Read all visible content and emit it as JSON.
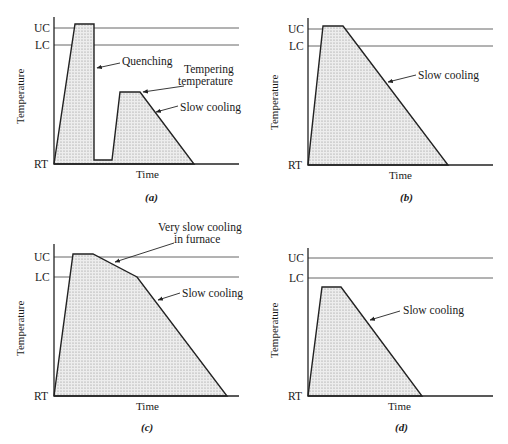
{
  "axis_labels": {
    "y": "Temperature",
    "x": "Time",
    "uc": "UC",
    "lc": "LC",
    "rt": "RT"
  },
  "panels": [
    {
      "id": "a",
      "caption": "(a)",
      "annotations": [
        "Quenching",
        "Tempering",
        "temperature",
        "Slow cooling"
      ]
    },
    {
      "id": "b",
      "caption": "(b)",
      "annotations": [
        "Slow cooling"
      ]
    },
    {
      "id": "c",
      "caption": "(c)",
      "annotations": [
        "Very slow cooling",
        "in furnace",
        "Slow cooling"
      ]
    },
    {
      "id": "d",
      "caption": "(d)",
      "annotations": [
        "Slow cooling"
      ]
    }
  ],
  "colors": {
    "line": "#222222",
    "reference_line": "#555555",
    "fill_dots": "#8a8a8a"
  }
}
